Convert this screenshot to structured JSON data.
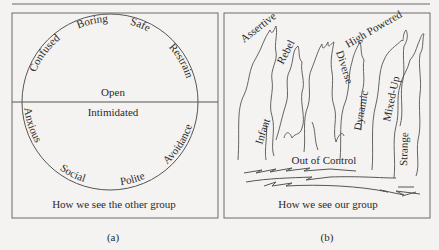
{
  "figure": {
    "panel_a": {
      "caption": "How we see the other group",
      "sublabel": "(a)",
      "upper_half": {
        "center_label": "Open",
        "arc_labels": [
          "Confused",
          "Boring",
          "Safe",
          "Restrain"
        ]
      },
      "lower_half": {
        "center_label": "Intimidated",
        "arc_labels": [
          "Anxious",
          "Social",
          "Polite",
          "Avoidance"
        ]
      }
    },
    "panel_b": {
      "caption": "How we see our group",
      "sublabel": "(b)",
      "flame_labels": [
        "Assertive",
        "Rebel",
        "Infant",
        "Diverse",
        "High Powered",
        "Dynamic",
        "Mixed-Up",
        "Strange"
      ],
      "base_label": "Out of Control"
    },
    "colors": {
      "line": "#555555",
      "frame": "#6a6a6a",
      "text": "#2b2b2b",
      "background": "#f4f3f1"
    }
  }
}
